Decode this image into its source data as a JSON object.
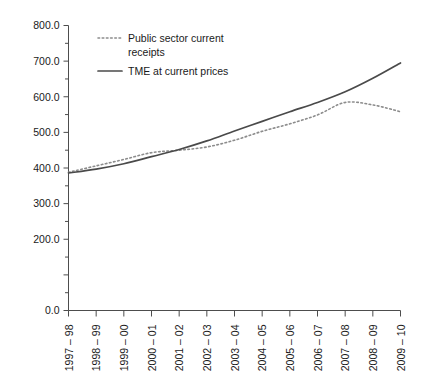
{
  "chart_data": {
    "type": "line",
    "title": "",
    "xlabel": "",
    "ylabel": "",
    "ylim": [
      0,
      800
    ],
    "ytick_step": 100,
    "yminor_step": 50,
    "grid": false,
    "legend_position": "top-left-inside",
    "yticks": [
      "0.0",
      "200.0",
      "300.0",
      "400.0",
      "500.0",
      "600.0",
      "700.0",
      "800.0"
    ],
    "ytick_values": [
      0,
      200,
      300,
      400,
      500,
      600,
      700,
      800
    ],
    "categories": [
      "1997 – 98",
      "1998 – 99",
      "1999 – 00",
      "2000 – 01",
      "2001 – 02",
      "2002 – 03",
      "2003 – 04",
      "2004 – 05",
      "2005 – 06",
      "2006 – 07",
      "2007 – 08",
      "2008 – 09",
      "2009 – 10"
    ],
    "series": [
      {
        "name": "Public sector current receipts",
        "style": "dotted",
        "color": "#8c8c8c",
        "values": [
          388,
          406,
          424,
          443,
          450,
          459,
          478,
          503,
          524,
          549,
          584,
          577,
          558
        ]
      },
      {
        "name": "TME at current prices",
        "style": "solid",
        "color": "#4a4a4a",
        "values": [
          386,
          397,
          412,
          432,
          452,
          476,
          504,
          531,
          558,
          584,
          614,
          652,
          695
        ]
      }
    ]
  },
  "legend": {
    "items": [
      {
        "label_line1": "Public sector current",
        "label_line2": "receipts",
        "style": "dotted"
      },
      {
        "label_line1": "TME at current prices",
        "label_line2": "",
        "style": "solid"
      }
    ]
  },
  "colors": {
    "axis": "#4d4d4d",
    "receipts": "#8c8c8c",
    "tme": "#4a4a4a",
    "background": "#ffffff",
    "text": "#1a1a1a"
  }
}
